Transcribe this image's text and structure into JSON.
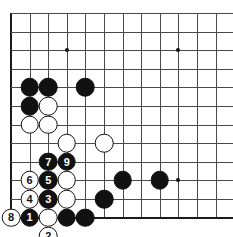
{
  "board": {
    "type": "go-board-diagram",
    "title": "",
    "origin_x": 11,
    "origin_y": 13,
    "spacing": 18.6,
    "cols": 13,
    "rows": 12,
    "stone_radius": 9.3,
    "colors": {
      "line": "#4a4a4a",
      "edge": "#1a1a1a",
      "black": "#111111",
      "white": "#ffffff"
    },
    "edges": {
      "left": true,
      "bottom": true,
      "top": false,
      "right": false
    },
    "hoshi": [
      {
        "col": 4,
        "row": 3
      },
      {
        "col": 10,
        "row": 3
      }
    ],
    "stones": [
      {
        "col": 2,
        "row": 5,
        "color": "black",
        "label": ""
      },
      {
        "col": 3,
        "row": 5,
        "color": "black",
        "label": ""
      },
      {
        "col": 5,
        "row": 5,
        "color": "black",
        "label": ""
      },
      {
        "col": 2,
        "row": 6,
        "color": "black",
        "label": ""
      },
      {
        "col": 3,
        "row": 6,
        "color": "white",
        "label": ""
      },
      {
        "col": 2,
        "row": 7,
        "color": "white",
        "label": ""
      },
      {
        "col": 3,
        "row": 7,
        "color": "white",
        "label": ""
      },
      {
        "col": 4,
        "row": 8,
        "color": "white",
        "label": ""
      },
      {
        "col": 6,
        "row": 8,
        "color": "white",
        "label": ""
      },
      {
        "col": 3,
        "row": 9,
        "color": "black",
        "label": "7"
      },
      {
        "col": 4,
        "row": 9,
        "color": "black",
        "label": "9"
      },
      {
        "col": 2,
        "row": 10,
        "color": "white",
        "label": "6"
      },
      {
        "col": 3,
        "row": 10,
        "color": "black",
        "label": "5"
      },
      {
        "col": 4,
        "row": 10,
        "color": "white",
        "label": ""
      },
      {
        "col": 7,
        "row": 10,
        "color": "black",
        "label": ""
      },
      {
        "col": 9,
        "row": 10,
        "color": "black",
        "label": ""
      },
      {
        "col": 2,
        "row": 11,
        "color": "white",
        "label": "4"
      },
      {
        "col": 3,
        "row": 11,
        "color": "black",
        "label": "3"
      },
      {
        "col": 4,
        "row": 11,
        "color": "white",
        "label": ""
      },
      {
        "col": 6,
        "row": 11,
        "color": "black",
        "label": ""
      },
      {
        "col": 1,
        "row": 12,
        "color": "white",
        "label": "8"
      },
      {
        "col": 2,
        "row": 12,
        "color": "black",
        "label": "1"
      },
      {
        "col": 3,
        "row": 12,
        "color": "white",
        "label": ""
      },
      {
        "col": 4,
        "row": 12,
        "color": "black",
        "label": ""
      },
      {
        "col": 5,
        "row": 12,
        "color": "black",
        "label": ""
      },
      {
        "col": 3,
        "row": 13,
        "color": "white",
        "label": "2"
      }
    ],
    "hoshi_right": {
      "col": 10,
      "row": 10
    }
  }
}
